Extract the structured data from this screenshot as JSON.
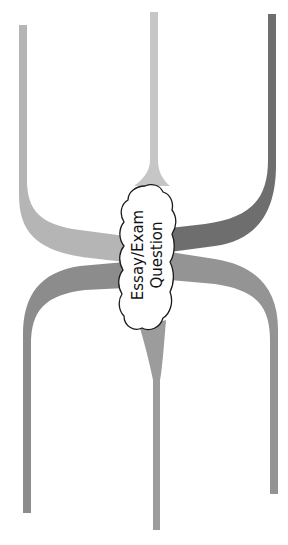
{
  "diagram": {
    "center_label": {
      "line1": "Essay/Exam",
      "line2": "Question"
    },
    "colors": {
      "background": "#ffffff",
      "top_left_branch": "#b5b5b5",
      "top_middle_branch": "#c6c6c6",
      "top_right_branch": "#6e6e6e",
      "bottom_left_branch": "#8c8c8c",
      "bottom_middle_branch": "#9c9c9c",
      "bottom_right_branch": "#949494",
      "cloud_fill": "#ffffff",
      "cloud_stroke": "#1a1a1a"
    },
    "branches": [
      {
        "id": "top-left"
      },
      {
        "id": "top-middle"
      },
      {
        "id": "top-right"
      },
      {
        "id": "bottom-left"
      },
      {
        "id": "bottom-middle"
      },
      {
        "id": "bottom-right"
      }
    ]
  }
}
